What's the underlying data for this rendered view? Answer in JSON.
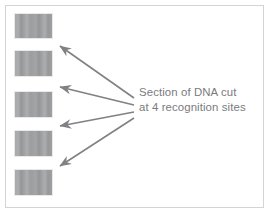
{
  "figure": {
    "width": 272,
    "height": 215,
    "background_color": "#ffffff",
    "frame_border_color": "#d4d4d4"
  },
  "caption": {
    "line1": "Section of DNA cut",
    "line2": "at 4 recognition sites",
    "text_color": "#7a7b7d"
  },
  "bands": {
    "fill_color": "#a0a1a3",
    "count": 5,
    "items": [
      {
        "name": "dna-band-1",
        "x": 14,
        "y": 13,
        "width": 39,
        "height": 26
      },
      {
        "name": "dna-band-2",
        "x": 14,
        "y": 50,
        "width": 39,
        "height": 27
      },
      {
        "name": "dna-band-3",
        "x": 14,
        "y": 91,
        "width": 39,
        "height": 27
      },
      {
        "name": "dna-band-4",
        "x": 14,
        "y": 130,
        "width": 39,
        "height": 27
      },
      {
        "name": "dna-band-5",
        "x": 14,
        "y": 169,
        "width": 39,
        "height": 27
      }
    ]
  },
  "arrows": {
    "color": "#808184",
    "stroke_width": 1.6,
    "count": 4,
    "items": [
      {
        "name": "arrow-to-cut-site-1",
        "x1": 134,
        "y1": 98,
        "x2": 60,
        "y2": 46
      },
      {
        "name": "arrow-to-cut-site-2",
        "x1": 134,
        "y1": 105,
        "x2": 60,
        "y2": 87
      },
      {
        "name": "arrow-to-cut-site-3",
        "x1": 134,
        "y1": 112,
        "x2": 60,
        "y2": 126
      },
      {
        "name": "arrow-to-cut-site-4",
        "x1": 134,
        "y1": 118,
        "x2": 60,
        "y2": 166
      }
    ]
  }
}
